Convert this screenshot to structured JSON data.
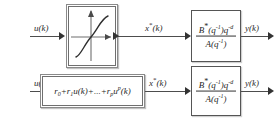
{
  "diagram": {
    "background_color": "#ffffff",
    "line_color": "#4d4d4d",
    "block_border_color": "#6f6f6f"
  },
  "rows": [
    {
      "id": "top-row",
      "input_label": "u(k)",
      "nonlinear_block": {
        "type": "static-nonlinearity-graph",
        "curve": "monotonic S-shaped saturation curve",
        "axes": "x-axis horizontal with arrow, y-axis vertical with arrow"
      },
      "intermediate_label": "x*(k)",
      "intermediate_label_base": "x",
      "intermediate_label_star": "*",
      "intermediate_label_arg": "(k)",
      "transfer_function": {
        "numerator_B": "B",
        "numerator_star": "*",
        "numerator_q": "(q",
        "numerator_q_exp": "-1",
        "numerator_q2": ")q",
        "numerator_q2_exp": "-d",
        "denominator_A": "A",
        "denominator_q": "(q",
        "denominator_q_exp": "-1",
        "denominator_close": ")"
      },
      "output_label": "y(k)"
    },
    {
      "id": "bottom-row",
      "input_label": "u(k)",
      "polynomial_block": {
        "r0": "r",
        "r0_sub": "0",
        "plus1": "+",
        "r1": "r",
        "r1_sub": "1",
        "u1": "u(k)",
        "plus2": "+...+",
        "rp": "r",
        "rp_sub": "p",
        "up": "u",
        "up_sup": "p",
        "up_arg": "(k)",
        "full_text": "r0+r1u(k)+...+rp u^p(k)"
      },
      "intermediate_label_base": "x",
      "intermediate_label_star": "*",
      "intermediate_label_arg": "(k)",
      "transfer_function": {
        "numerator_B": "B",
        "numerator_star": "*",
        "numerator_q": "(q",
        "numerator_q_exp": "-1",
        "numerator_q2": ")q",
        "numerator_q2_exp": "-d",
        "denominator_A": "A",
        "denominator_q": "(q",
        "denominator_q_exp": "-1",
        "denominator_close": ")"
      },
      "output_label": "y(k)"
    }
  ]
}
